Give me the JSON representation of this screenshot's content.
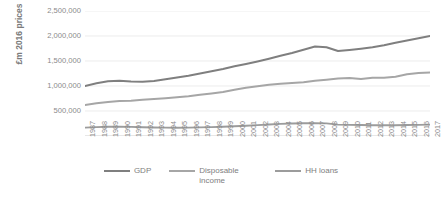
{
  "chart_data": {
    "type": "line",
    "title": "",
    "xlabel": "",
    "ylabel": "£m 2016 prices",
    "grid": true,
    "legend_position": "bottom",
    "ylim": [
      0,
      2500000
    ],
    "ytick_values": [
      0,
      500000,
      1000000,
      1500000,
      2000000,
      2500000
    ],
    "ytick_labels": [
      "",
      "500,000",
      "1,000,000",
      "1,500,000",
      "2,000,000",
      "2,500,000"
    ],
    "x": [
      1987,
      1988,
      1989,
      1990,
      1991,
      1992,
      1993,
      1994,
      1995,
      1996,
      1997,
      1998,
      1999,
      2000,
      2001,
      2002,
      2003,
      2004,
      2005,
      2006,
      2007,
      2008,
      2009,
      2010,
      2011,
      2012,
      2013,
      2014,
      2015,
      2016,
      2017
    ],
    "xtick_labels": [
      "1987",
      "1988",
      "1989",
      "1990",
      "1991",
      "1992",
      "1993",
      "1994",
      "1995",
      "1996",
      "1997",
      "1998",
      "1999",
      "2000",
      "2001",
      "2002",
      "2003",
      "2004",
      "2005",
      "2006",
      "2007",
      "2008",
      "2009",
      "2010",
      "2011",
      "2012",
      "2013",
      "2014",
      "2015",
      "2016",
      "2017"
    ],
    "series": [
      {
        "name": "GDP",
        "color": "#7f7f7f",
        "values": [
          1000000,
          1055000,
          1095000,
          1105000,
          1090000,
          1085000,
          1100000,
          1135000,
          1170000,
          1205000,
          1250000,
          1295000,
          1340000,
          1395000,
          1440000,
          1490000,
          1545000,
          1605000,
          1660000,
          1725000,
          1790000,
          1775000,
          1700000,
          1720000,
          1745000,
          1775000,
          1815000,
          1865000,
          1910000,
          1955000,
          2000000
        ]
      },
      {
        "name": "Disposable income",
        "color": "#a6a6a6",
        "values": [
          620000,
          655000,
          680000,
          700000,
          705000,
          725000,
          740000,
          755000,
          775000,
          795000,
          825000,
          850000,
          880000,
          925000,
          965000,
          995000,
          1025000,
          1045000,
          1060000,
          1075000,
          1105000,
          1125000,
          1150000,
          1160000,
          1140000,
          1165000,
          1165000,
          1185000,
          1235000,
          1260000,
          1270000
        ]
      },
      {
        "name": "HH loans",
        "color": "#9c9c9c",
        "values": [
          168000,
          178000,
          186000,
          188000,
          183000,
          176000,
          170000,
          168000,
          166000,
          167000,
          172000,
          178000,
          186000,
          196000,
          206000,
          218000,
          231000,
          243000,
          250000,
          255000,
          258000,
          252000,
          228000,
          222000,
          219000,
          216000,
          215000,
          216000,
          219000,
          223000,
          228000
        ]
      }
    ]
  },
  "legend": {
    "items": [
      {
        "label": "GDP",
        "color": "#7f7f7f"
      },
      {
        "label": "Disposable income",
        "color": "#a6a6a6"
      },
      {
        "label": "HH loans",
        "color": "#9c9c9c"
      }
    ]
  }
}
